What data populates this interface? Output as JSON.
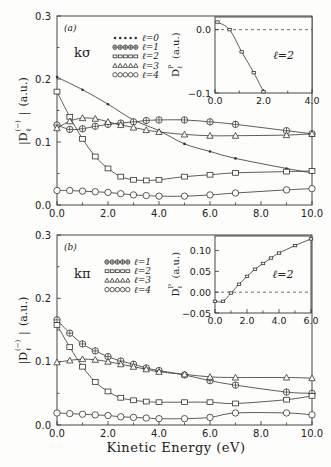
{
  "figure": {
    "xlabel": "Kinetic Energy (eV)",
    "ylabel_main": "|D",
    "ylabel_sub": "ℓ",
    "ylabel_sup": "(−)",
    "ylabel_units": "(a.u.)"
  },
  "chart_data": [
    {
      "type": "line",
      "panel": "(a)",
      "label": "kσ",
      "xlabel": "Kinetic Energy (eV)",
      "ylabel": "|D_ℓ^(−)| (a.u.)",
      "xlim": [
        0,
        10
      ],
      "ylim": [
        0,
        0.3
      ],
      "xticks": [
        "0.0",
        "2.0",
        "4.0",
        "6.0",
        "8.0",
        "10.0"
      ],
      "yticks": [
        "0.0",
        "0.1",
        "0.2",
        "0.3"
      ],
      "legend": [
        "ℓ=0",
        "ℓ=1",
        "ℓ=2",
        "ℓ=3",
        "ℓ=4"
      ],
      "series": [
        {
          "name": "ℓ=0",
          "marker": "star",
          "x": [
            0,
            1,
            2,
            3,
            4,
            5,
            6,
            7,
            9,
            10
          ],
          "y": [
            0.203,
            0.183,
            0.16,
            0.135,
            0.118,
            0.097,
            0.085,
            0.074,
            0.058,
            0.051
          ]
        },
        {
          "name": "ℓ=1",
          "marker": "circle-plus",
          "x": [
            0,
            0.5,
            1,
            1.5,
            2,
            2.5,
            3,
            3.5,
            4,
            5,
            6,
            7,
            9,
            10
          ],
          "y": [
            0.127,
            0.12,
            0.121,
            0.125,
            0.128,
            0.13,
            0.132,
            0.134,
            0.135,
            0.135,
            0.132,
            0.128,
            0.118,
            0.113
          ]
        },
        {
          "name": "ℓ=2",
          "marker": "square",
          "x": [
            0,
            0.5,
            1,
            1.5,
            2,
            2.5,
            3,
            3.5,
            4,
            5,
            6,
            7,
            9,
            10
          ],
          "y": [
            0.18,
            0.14,
            0.105,
            0.077,
            0.058,
            0.045,
            0.04,
            0.039,
            0.04,
            0.045,
            0.048,
            0.051,
            0.053,
            0.054
          ]
        },
        {
          "name": "ℓ=3",
          "marker": "triangle",
          "x": [
            0,
            0.5,
            1,
            1.5,
            2,
            2.5,
            3,
            3.5,
            4,
            5,
            6,
            7,
            9,
            10
          ],
          "y": [
            0.122,
            0.133,
            0.138,
            0.137,
            0.132,
            0.127,
            0.123,
            0.119,
            0.116,
            0.112,
            0.11,
            0.11,
            0.111,
            0.113
          ]
        },
        {
          "name": "ℓ=4",
          "marker": "circle",
          "x": [
            0,
            0.5,
            1,
            1.5,
            2,
            2.5,
            3,
            3.5,
            4,
            5,
            6,
            7,
            9,
            10
          ],
          "y": [
            0.023,
            0.023,
            0.022,
            0.021,
            0.02,
            0.018,
            0.016,
            0.015,
            0.014,
            0.014,
            0.016,
            0.019,
            0.024,
            0.026
          ]
        }
      ],
      "inset": {
        "xlim": [
          0,
          4
        ],
        "ylim": [
          -0.1,
          0.02
        ],
        "xticks": [
          "0.0",
          "2.0",
          "4.0"
        ],
        "yticks": [
          "0.0",
          "−0.1"
        ],
        "ylabel": "D_ℓ^P (a.u.)",
        "annotation": "ℓ=2",
        "series": [
          {
            "name": "ℓ=2",
            "x": [
              0.1,
              0.6,
              1.1,
              1.6,
              2.0
            ],
            "y": [
              0.012,
              0.0,
              -0.035,
              -0.068,
              -0.098
            ]
          }
        ]
      }
    },
    {
      "type": "line",
      "panel": "(b)",
      "label": "kπ",
      "xlabel": "Kinetic Energy (eV)",
      "ylabel": "|D_ℓ^(−)| (a.u.)",
      "xlim": [
        0,
        10
      ],
      "ylim": [
        0,
        0.3
      ],
      "xticks": [
        "0.0",
        "2.0",
        "4.0",
        "6.0",
        "8.0",
        "10.0"
      ],
      "yticks": [
        "0.0",
        "0.1",
        "0.2",
        "0.3"
      ],
      "legend": [
        "ℓ=1",
        "ℓ=2",
        "ℓ=3",
        "ℓ=4"
      ],
      "series": [
        {
          "name": "ℓ=1",
          "marker": "circle-plus",
          "x": [
            0,
            0.5,
            1,
            1.5,
            2,
            2.5,
            3,
            3.5,
            4,
            5,
            6,
            7,
            9,
            10
          ],
          "y": [
            0.166,
            0.145,
            0.128,
            0.117,
            0.108,
            0.101,
            0.096,
            0.09,
            0.086,
            0.079,
            0.07,
            0.063,
            0.052,
            0.05
          ]
        },
        {
          "name": "ℓ=2",
          "marker": "square",
          "x": [
            0,
            0.5,
            1,
            1.5,
            2,
            2.5,
            3,
            3.5,
            4,
            5,
            6,
            7,
            9,
            10
          ],
          "y": [
            0.158,
            0.123,
            0.092,
            0.068,
            0.053,
            0.043,
            0.039,
            0.037,
            0.036,
            0.036,
            0.036,
            0.034,
            0.04,
            0.046
          ]
        },
        {
          "name": "ℓ=3",
          "marker": "triangle",
          "x": [
            0,
            0.5,
            1,
            1.5,
            2,
            2.5,
            3,
            3.5,
            4,
            5,
            6,
            7,
            9,
            10
          ],
          "y": [
            0.099,
            0.102,
            0.104,
            0.103,
            0.1,
            0.096,
            0.092,
            0.088,
            0.084,
            0.08,
            0.076,
            0.075,
            0.075,
            0.074
          ]
        },
        {
          "name": "ℓ=4",
          "marker": "circle",
          "x": [
            0,
            0.5,
            1,
            1.5,
            2,
            2.5,
            3,
            3.5,
            4,
            5,
            6,
            7,
            9,
            10
          ],
          "y": [
            0.019,
            0.018,
            0.017,
            0.016,
            0.015,
            0.013,
            0.012,
            0.011,
            0.01,
            0.01,
            0.012,
            0.019,
            0.019,
            0.016
          ]
        }
      ],
      "inset": {
        "xlim": [
          0,
          6
        ],
        "ylim": [
          -0.05,
          0.135
        ],
        "xticks": [
          "0.0",
          "2.0",
          "4.0",
          "6.0"
        ],
        "yticks": [
          "0.10",
          "0.05",
          "0.00",
          "−0.05"
        ],
        "ylabel": "D_ℓ^P (a.u.)",
        "annotation": "ℓ=2",
        "series": [
          {
            "name": "ℓ=2",
            "x": [
              0,
              0.5,
              1,
              1.5,
              2,
              2.5,
              3,
              3.5,
              4,
              5,
              6
            ],
            "y": [
              -0.022,
              -0.022,
              -0.002,
              0.019,
              0.038,
              0.055,
              0.069,
              0.082,
              0.094,
              0.112,
              0.128
            ]
          }
        ]
      }
    }
  ]
}
